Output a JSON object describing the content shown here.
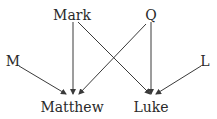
{
  "diagram": {
    "type": "dependency-graph",
    "line_color": "#3a3a3a",
    "text_color": "#2a2a2a",
    "nodes": [
      {
        "id": "mark",
        "label": "Mark",
        "x": 72,
        "y": 15
      },
      {
        "id": "q",
        "label": "Q",
        "x": 151,
        "y": 15
      },
      {
        "id": "m",
        "label": "M",
        "x": 13,
        "y": 61
      },
      {
        "id": "l",
        "label": "L",
        "x": 205,
        "y": 61
      },
      {
        "id": "matthew",
        "label": "Matthew",
        "x": 72,
        "y": 107
      },
      {
        "id": "luke",
        "label": "Luke",
        "x": 151,
        "y": 107
      }
    ],
    "edges": [
      {
        "from": "mark",
        "to": "matthew"
      },
      {
        "from": "mark",
        "to": "luke"
      },
      {
        "from": "q",
        "to": "matthew"
      },
      {
        "from": "q",
        "to": "luke"
      },
      {
        "from": "m",
        "to": "matthew"
      },
      {
        "from": "l",
        "to": "luke"
      }
    ]
  }
}
